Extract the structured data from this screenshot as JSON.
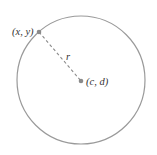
{
  "diagram": {
    "title": "",
    "circle": {
      "cx": 81,
      "cy": 80,
      "r": 64,
      "stroke": "#9a9a9a"
    },
    "point_on_circle": {
      "x": 39,
      "y": 32,
      "label": "(x, y)",
      "color": "#8a8a8a"
    },
    "center": {
      "x": 81,
      "y": 81,
      "label": "(c, d)",
      "color": "#8a8a8a"
    },
    "radius_segment": {
      "label": "r",
      "style": "dashed",
      "color": "#8a8a8a"
    }
  }
}
